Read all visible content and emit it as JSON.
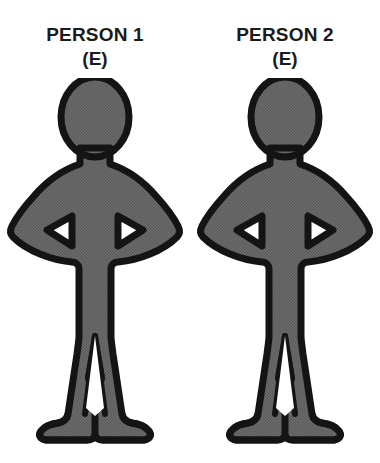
{
  "canvas": {
    "width": 380,
    "height": 463,
    "background_color": "#ffffff"
  },
  "style": {
    "outline_color": "#141414",
    "fill_color": "#6e6e6e",
    "halftone_dark": "#2b2b2b",
    "halftone_light": "#9a9a9a",
    "text_color": "#1b1b1b",
    "hole_color": "#ffffff"
  },
  "figures": [
    {
      "id": "person-1",
      "title": "PERSON 1",
      "code": "(E)",
      "pose_name": "standing-hands-on-hips",
      "fill": "#6e6e6e",
      "outline": "#141414"
    },
    {
      "id": "person-2",
      "title": "PERSON 2",
      "code": "(E)",
      "pose_name": "standing-hands-on-hips",
      "fill": "#6e6e6e",
      "outline": "#141414"
    }
  ],
  "icons": {
    "person_figure": "person-standing-akimbo-icon",
    "arm_gap_left": "triangle-left-icon",
    "arm_gap_right": "triangle-right-icon"
  }
}
